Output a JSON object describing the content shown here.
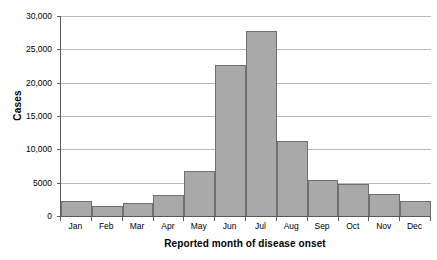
{
  "chart_data": {
    "type": "bar",
    "title": "",
    "xlabel": "Reported month of disease onset",
    "ylabel": "Cases",
    "categories": [
      "Jan",
      "Feb",
      "Mar",
      "Apr",
      "May",
      "Jun",
      "Jul",
      "Aug",
      "Sep",
      "Oct",
      "Nov",
      "Dec"
    ],
    "values": [
      2200,
      1500,
      2000,
      3200,
      6800,
      22600,
      27700,
      11200,
      5400,
      4800,
      3300,
      2300
    ],
    "ylim": [
      0,
      30000
    ],
    "ytick_values": [
      0,
      5000,
      10000,
      15000,
      20000,
      25000,
      30000
    ],
    "ytick_labels": [
      "0",
      "5000",
      "10,000",
      "15,000",
      "20,000",
      "25,000",
      "30,000"
    ],
    "grid": true,
    "legend": false,
    "legend_position": "none",
    "bar_fill_color": "#a9a9a9",
    "bar_edge_color": "#6f6f6f",
    "gridline_color": "#b9b9b9",
    "axis_color": "#5a5a5a",
    "background_color": "#ffffff"
  }
}
